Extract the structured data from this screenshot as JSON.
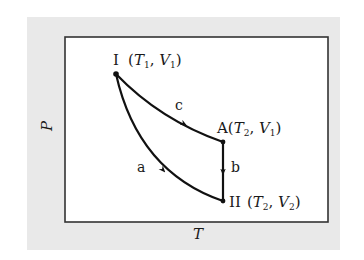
{
  "diagram": {
    "type": "P-T thermodynamic process diagram",
    "axes": {
      "y_label": "P",
      "x_label": "T"
    },
    "points": [
      {
        "id": "I",
        "label": "I",
        "coords_text": "(T1, V1)",
        "T_sub": "1",
        "V_sub": "1"
      },
      {
        "id": "A",
        "label": "A",
        "coords_text": "(T2, V1)",
        "T_sub": "2",
        "V_sub": "1"
      },
      {
        "id": "II",
        "label": "II",
        "coords_text": "(T2, V2)",
        "T_sub": "2",
        "V_sub": "2"
      }
    ],
    "paths": [
      {
        "id": "a",
        "label": "a",
        "from": "I",
        "to": "II",
        "shape": "concave curve",
        "direction": "I to II"
      },
      {
        "id": "c",
        "label": "c",
        "from": "I",
        "to": "A",
        "shape": "gentle curve",
        "direction": "I to A"
      },
      {
        "id": "b",
        "label": "b",
        "from": "A",
        "to": "II",
        "shape": "vertical line",
        "direction": "A to II"
      }
    ],
    "colors": {
      "line": "#111111",
      "panel_bg": "#e9e9e9",
      "frame_bg": "#ffffff",
      "frame_border": "#333333"
    }
  }
}
